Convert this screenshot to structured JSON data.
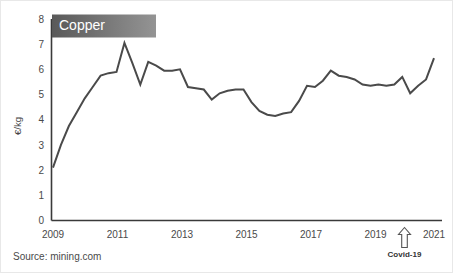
{
  "figure": {
    "background_color": "#ffffff",
    "title_box": {
      "label": "Copper",
      "gradient_from": "#595959",
      "gradient_to": "#8f8f8f",
      "text_color": "#ffffff"
    },
    "source": "Source: mining.com",
    "line_color": "#4a4a4a",
    "axis_color": "#3a3a3a"
  },
  "chart_data": {
    "type": "line",
    "title": "Copper",
    "xlabel": "",
    "ylabel": "€/kg",
    "ylim": [
      0,
      8
    ],
    "xlim": [
      2009,
      2021
    ],
    "yticks": [
      0,
      1,
      2,
      3,
      4,
      5,
      6,
      7,
      8
    ],
    "xticks": [
      2009,
      2011,
      2013,
      2015,
      2017,
      2019,
      2021
    ],
    "grid": false,
    "legend": false,
    "units": "€/kg",
    "annotations": [
      {
        "label": "Covid-19",
        "x": 2020.25,
        "type": "up-arrow-below-axis"
      }
    ],
    "series": [
      {
        "name": "Copper",
        "x": [
          2009.0,
          2009.25,
          2009.5,
          2009.75,
          2010.0,
          2010.25,
          2010.5,
          2010.75,
          2011.0,
          2011.25,
          2011.5,
          2011.75,
          2012.0,
          2012.25,
          2012.5,
          2012.75,
          2013.0,
          2013.25,
          2013.5,
          2013.75,
          2014.0,
          2014.25,
          2014.5,
          2014.75,
          2015.0,
          2015.25,
          2015.5,
          2015.75,
          2016.0,
          2016.25,
          2016.5,
          2016.75,
          2017.0,
          2017.25,
          2017.5,
          2017.75,
          2018.0,
          2018.25,
          2018.5,
          2018.75,
          2019.0,
          2019.25,
          2019.5,
          2019.75,
          2020.0,
          2020.25,
          2020.5,
          2020.75,
          2021.0
        ],
        "values": [
          2.1,
          3.0,
          3.75,
          4.3,
          4.85,
          5.3,
          5.75,
          5.85,
          5.9,
          7.05,
          6.25,
          5.4,
          6.3,
          6.15,
          5.95,
          5.95,
          6.0,
          5.3,
          5.25,
          5.2,
          4.8,
          5.05,
          5.15,
          5.2,
          5.2,
          4.7,
          4.35,
          4.2,
          4.15,
          4.25,
          4.3,
          4.75,
          5.35,
          5.3,
          5.55,
          5.95,
          5.75,
          5.7,
          5.6,
          5.4,
          5.35,
          5.4,
          5.35,
          5.4,
          5.7,
          5.05,
          5.35,
          5.6,
          6.45
        ]
      }
    ]
  }
}
